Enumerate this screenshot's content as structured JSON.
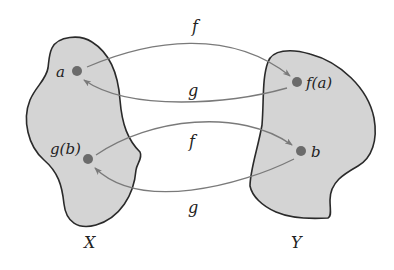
{
  "diagram": {
    "sets": [
      {
        "name": "X",
        "label": "X"
      },
      {
        "name": "Y",
        "label": "Y"
      }
    ],
    "points": {
      "a": "a",
      "fa": "f(a)",
      "gb": "g(b)",
      "b": "b"
    },
    "arrows": [
      {
        "from": "a",
        "to": "f(a)",
        "label": "f"
      },
      {
        "from": "f(a)",
        "to": "a",
        "label": "g"
      },
      {
        "from": "g(b)",
        "to": "b",
        "label": "f"
      },
      {
        "from": "b",
        "to": "g(b)",
        "label": "g"
      }
    ],
    "colors": {
      "set_fill": "#d4d4d4",
      "set_stroke": "#2a2a2a",
      "point": "#6b6b6b",
      "arrow": "#7a7a7a"
    }
  }
}
